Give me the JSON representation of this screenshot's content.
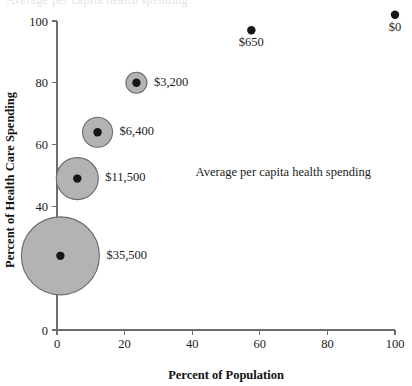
{
  "chart_data": {
    "type": "scatter",
    "title": "",
    "xlabel": "Percent of Population",
    "ylabel": "Percent of Health Care Spending",
    "xlim": [
      0,
      100
    ],
    "ylim": [
      0,
      100
    ],
    "xticks": [
      0,
      20,
      40,
      60,
      80,
      100
    ],
    "yticks": [
      0,
      20,
      40,
      60,
      80,
      100
    ],
    "xticklabels": [
      "0",
      "20",
      "40",
      "60",
      "80",
      "100"
    ],
    "yticklabels": [
      "0",
      "20",
      "40",
      "60",
      "80",
      "100"
    ],
    "grid": false,
    "legend": false,
    "annotations": [
      {
        "text": "Average per capita health spending",
        "x": 41,
        "y": 51
      }
    ],
    "size_encoding": "bubble area encodes average per capita health spending",
    "points": [
      {
        "label": "$35,500",
        "value": 35500,
        "x": 1,
        "y": 24,
        "bubble_radius_px": 39,
        "has_bubble": true,
        "label_side": "right"
      },
      {
        "label": "$11,500",
        "value": 11500,
        "x": 6,
        "y": 49,
        "bubble_radius_px": 21,
        "has_bubble": true,
        "label_side": "right"
      },
      {
        "label": "$6,400",
        "value": 6400,
        "x": 12,
        "y": 64,
        "bubble_radius_px": 15,
        "has_bubble": true,
        "label_side": "right"
      },
      {
        "label": "$3,200",
        "value": 3200,
        "x": 23.5,
        "y": 80,
        "bubble_radius_px": 10.5,
        "has_bubble": true,
        "label_side": "right"
      },
      {
        "label": "$650",
        "value": 650,
        "x": 57.5,
        "y": 97,
        "bubble_radius_px": 0,
        "has_bubble": false,
        "label_side": "below"
      },
      {
        "label": "$0",
        "value": 0,
        "x": 100,
        "y": 102,
        "bubble_radius_px": 0,
        "has_bubble": false,
        "label_side": "below"
      }
    ]
  },
  "colors": {
    "bubble_fill": "#b3b3b3",
    "bubble_stroke": "#6b6b6b",
    "dot_fill": "#161616",
    "axis": "#6e6e6e",
    "text": "#1c1c1c",
    "background": "#ffffff"
  },
  "cropped_header": {
    "text": "Average per capita health spending"
  }
}
